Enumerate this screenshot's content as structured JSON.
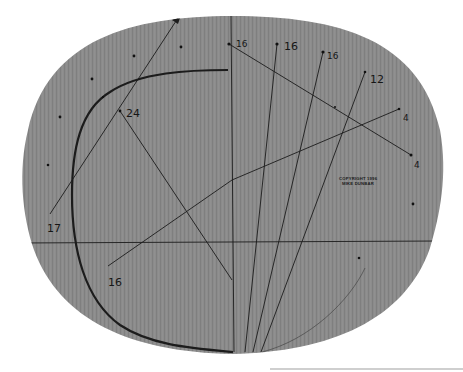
{
  "board": {
    "fill": "#8a8a8a",
    "grain": "#7c7c7c",
    "line_color": "#1c1c1c"
  },
  "labels": [
    {
      "id": "label-24",
      "text": "24",
      "x": 126,
      "y": 117
    },
    {
      "id": "label-17",
      "text": "17",
      "x": 47,
      "y": 232
    },
    {
      "id": "label-16-bottom",
      "text": "16",
      "x": 108,
      "y": 286
    },
    {
      "id": "label-16-a",
      "text": "16",
      "x": 236,
      "y": 47
    },
    {
      "id": "label-16-b",
      "text": "16",
      "x": 284,
      "y": 50
    },
    {
      "id": "label-16-c",
      "text": "16",
      "x": 327,
      "y": 59
    },
    {
      "id": "label-12",
      "text": "12",
      "x": 370,
      "y": 83
    },
    {
      "id": "label-4-a",
      "text": "4",
      "x": 403,
      "y": 121
    },
    {
      "id": "label-4-b",
      "text": "4",
      "x": 414,
      "y": 168
    }
  ],
  "copyright": {
    "line1": "COPYRIGHT 1996",
    "line2": "MIKE DUNBAR"
  }
}
